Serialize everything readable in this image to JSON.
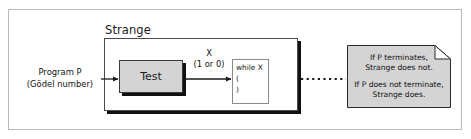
{
  "diagram": {
    "background_color": "#ffffff",
    "frame_border_color": "#b9b9b9",
    "outer_container": {
      "label": "Strange",
      "border_color": "#4a4a4a",
      "shadow_color": "#111111"
    },
    "input": {
      "line1": "Program P",
      "line2": "(Gödel number)"
    },
    "test_block": {
      "label": "Test",
      "fill_color": "#d4d4d4",
      "border_color": "#3a3a3a"
    },
    "signal": {
      "name": "X",
      "values": "(1 or 0)"
    },
    "while_block": {
      "lines": [
        "while X",
        "(",
        ")"
      ],
      "border_color": "#8a8a8a"
    },
    "connector": {
      "style": "dotted",
      "color": "#1a1a1a"
    },
    "note": {
      "fill_color": "#d4d4d4",
      "border_color": "#2a2a2a",
      "paragraph1": "If P terminates,\nStrange does not.",
      "paragraph2": "If P does not terminate,\nStrange does."
    }
  }
}
